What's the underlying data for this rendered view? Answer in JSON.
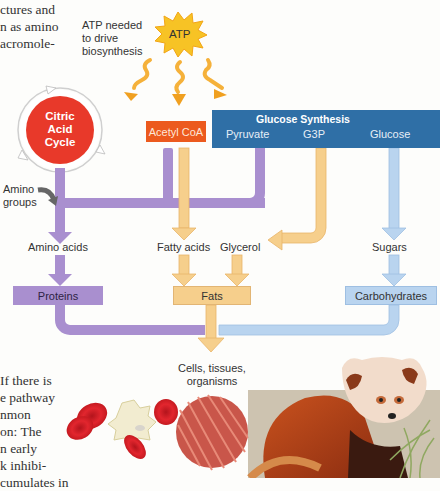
{
  "body_text_top": [
    "ctures and",
    "n as amino",
    "acromole-"
  ],
  "body_text_bottom": [
    "If there is",
    "e pathway",
    "nmon",
    "on: The",
    "n early",
    "k inhibi-",
    "cumulates in"
  ],
  "atp": {
    "label": "ATP",
    "caption": [
      "ATP needed",
      "to drive",
      "biosynthesis"
    ]
  },
  "citric": {
    "lines": [
      "Citric",
      "Acid",
      "Cycle"
    ]
  },
  "acetyl": "Acetyl CoA",
  "glucose_synthesis": {
    "title": "Glucose Synthesis",
    "steps": [
      "Pyruvate",
      "G3P",
      "Glucose"
    ]
  },
  "amino_groups": [
    "Amino",
    "groups"
  ],
  "intermediates": {
    "amino_acids": "Amino acids",
    "fatty_acids": "Fatty acids",
    "glycerol": "Glycerol",
    "sugars": "Sugars"
  },
  "macromolecules": {
    "proteins": "Proteins",
    "fats": "Fats",
    "carbohydrates": "Carbohydrates"
  },
  "output": [
    "Cells, tissues,",
    "organisms"
  ],
  "colors": {
    "purple": "#a98fcf",
    "orange": "#f6cf8c",
    "blue": "#b9d4ef",
    "citric_red": "#e8392a",
    "acetyl_orange": "#ec5a1e",
    "glucose_blue": "#2f6fa6",
    "atp_yellow": "#f7c325"
  }
}
